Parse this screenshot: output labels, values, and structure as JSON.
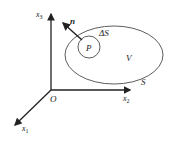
{
  "diagram": {
    "type": "3d-coordinate-region",
    "axes": {
      "origin_label": "O",
      "x1": {
        "label": "x",
        "subscript": "1"
      },
      "x2": {
        "label": "x",
        "subscript": "2"
      },
      "x3": {
        "label": "x",
        "subscript": "3"
      }
    },
    "region": {
      "volume_label": "V",
      "surface_label": "S"
    },
    "element": {
      "point_label": "P",
      "area_label": "ΔS",
      "normal_label": "n"
    },
    "colors": {
      "stroke": "#222222",
      "background": "#ffffff"
    }
  }
}
